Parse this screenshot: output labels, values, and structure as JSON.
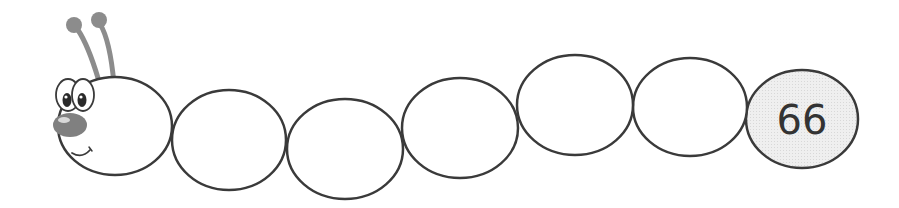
{
  "caterpillar": {
    "segments": [
      {
        "index": 1,
        "value": ""
      },
      {
        "index": 2,
        "value": ""
      },
      {
        "index": 3,
        "value": ""
      },
      {
        "index": 4,
        "value": ""
      },
      {
        "index": 5,
        "value": ""
      },
      {
        "index": 6,
        "value": "66"
      }
    ]
  },
  "colors": {
    "outline": "#3a3a3a",
    "antenna": "#8c8c8c",
    "nose": "#808080",
    "filled_segment": "#ececec",
    "background": "#ffffff"
  }
}
